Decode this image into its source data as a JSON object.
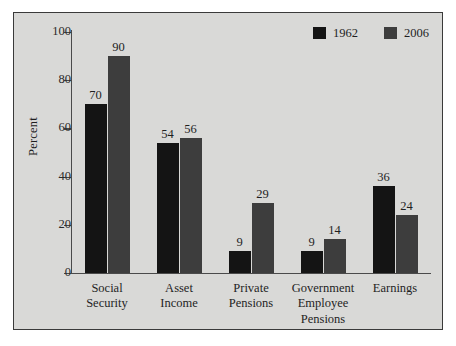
{
  "chart_data": {
    "type": "bar",
    "title": "",
    "xlabel": "",
    "ylabel": "Percent",
    "ylim": [
      0,
      100
    ],
    "yticks": [
      "0",
      "20",
      "40",
      "60",
      "80",
      "100"
    ],
    "grid": false,
    "legend_position": "top-right",
    "categories": [
      "Social\nSecurity",
      "Asset\nIncome",
      "Private\nPensions",
      "Government\nEmployee\nPensions",
      "Earnings"
    ],
    "category_lines": [
      [
        "Social",
        "Security"
      ],
      [
        "Asset",
        "Income"
      ],
      [
        "Private",
        "Pensions"
      ],
      [
        "Government",
        "Employee",
        "Pensions"
      ],
      [
        "Earnings"
      ]
    ],
    "series": [
      {
        "name": "1962",
        "color": "#141414",
        "values": [
          70,
          54,
          9,
          9,
          36
        ]
      },
      {
        "name": "2006",
        "color": "#3d3d3d",
        "values": [
          90,
          56,
          29,
          14,
          24
        ]
      }
    ]
  },
  "legend": {
    "items": [
      {
        "label": "1962",
        "color": "#141414"
      },
      {
        "label": "2006",
        "color": "#3d3d3d"
      }
    ]
  },
  "colors": {
    "panel_background": "#d9d9d7",
    "page_background": "#ffffff",
    "frame": "#3a3a3a",
    "axis": "#4a4a4a",
    "text": "#1f1f1f",
    "series_1962": "#141414",
    "series_2006": "#3d3d3d"
  }
}
